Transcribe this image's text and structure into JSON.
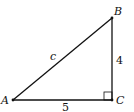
{
  "diagram": {
    "type": "right-triangle",
    "vertices": [
      {
        "name": "A",
        "x": 13,
        "y": 100
      },
      {
        "name": "B",
        "x": 112,
        "y": 18
      },
      {
        "name": "C",
        "x": 112,
        "y": 100
      }
    ],
    "vertex_labels": {
      "A": "A",
      "B": "B",
      "C": "C"
    },
    "side_labels": {
      "hypotenuse": "c",
      "vertical": "4",
      "horizontal": "5"
    },
    "right_angle_at": "C",
    "stroke_color": "#111111"
  }
}
